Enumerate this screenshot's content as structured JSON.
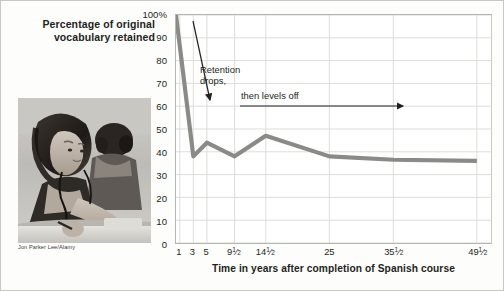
{
  "figure": {
    "photo": {
      "alt_name": "language-lab-students-photo",
      "caption": "Jon Parker Lee/Alamy"
    },
    "annotations": [
      {
        "id": "retention-drops",
        "line1": "Retention",
        "line2": "drops,",
        "arrow": "diagonal-down-arrow"
      },
      {
        "id": "levels-off",
        "text": "then levels off",
        "arrow": "right-arrow"
      }
    ]
  },
  "chart_data": {
    "type": "line",
    "title": "",
    "ylabel": "Percentage of original vocabulary retained",
    "xlabel": "Time in years after completion of Spanish course",
    "ylim": [
      0,
      100
    ],
    "y_ticks": [
      "0",
      "10",
      "20",
      "30",
      "40",
      "50",
      "60",
      "70",
      "80",
      "90",
      "100%"
    ],
    "y_tick_values": [
      0,
      10,
      20,
      30,
      40,
      50,
      60,
      70,
      80,
      90,
      100
    ],
    "categories": [
      "1",
      "3",
      "5",
      "9½",
      "14½",
      "25",
      "35½",
      "49½"
    ],
    "x_tick_labels": [
      {
        "whole": "1",
        "num": "",
        "den": ""
      },
      {
        "whole": "3",
        "num": "",
        "den": ""
      },
      {
        "whole": "5",
        "num": "",
        "den": ""
      },
      {
        "whole": "9",
        "num": "1",
        "den": "2"
      },
      {
        "whole": "14",
        "num": "1",
        "den": "2"
      },
      {
        "whole": "25",
        "num": "",
        "den": ""
      },
      {
        "whole": "35",
        "num": "1",
        "den": "2"
      },
      {
        "whole": "49",
        "num": "1",
        "den": "2"
      }
    ],
    "x_tick_positions": [
      0.012,
      0.055,
      0.098,
      0.186,
      0.285,
      0.487,
      0.69,
      0.955
    ],
    "series": [
      {
        "name": "Percentage of original vocabulary retained",
        "color": "#8a8a88",
        "x": [
          0.0,
          0.055,
          0.098,
          0.186,
          0.285,
          0.487,
          0.69,
          0.955
        ],
        "values": [
          100,
          38,
          44,
          38,
          47,
          38,
          36.5,
          36
        ]
      }
    ],
    "grid": true,
    "legend": "none",
    "colors": {
      "line": "#8a8a88",
      "grid": "#d9d9d6",
      "axis": "#b5b5b2",
      "text": "#231f20",
      "annotation_arrow": "#231f20"
    }
  }
}
